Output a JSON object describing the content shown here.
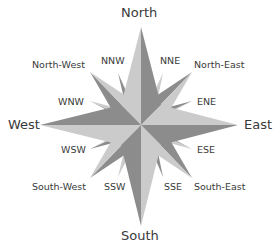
{
  "diagram": {
    "type": "compass-rose",
    "colors": {
      "light": "#cbcbcb",
      "dark": "#8c8c8c",
      "text": "#3a3a3a",
      "background": "#ffffff"
    },
    "labels": {
      "north": "North",
      "south": "South",
      "east": "East",
      "west": "West",
      "north_east": "North-East",
      "north_west": "North-West",
      "south_east": "South-East",
      "south_west": "South-West",
      "nne": "NNE",
      "nnw": "NNW",
      "ene": "ENE",
      "wnw": "WNW",
      "ese": "ESE",
      "wsw": "WSW",
      "sse": "SSE",
      "ssw": "SSW"
    }
  }
}
